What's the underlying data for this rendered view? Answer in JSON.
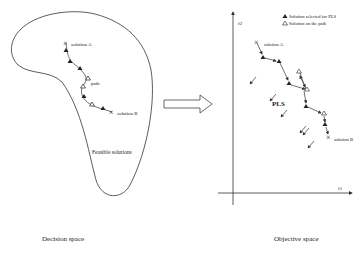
{
  "decision_space": {
    "caption": "Decision space",
    "region_label": "Feasible solutions",
    "solution_a_label": "solution A",
    "solution_b_label": "solution B",
    "path_label": "path"
  },
  "objective_space": {
    "caption": "Objective space",
    "y_axis_label": "f2",
    "x_axis_label": "f1",
    "solution_a_label": "solution A",
    "solution_b_label": "solution B",
    "method_label": "PLS",
    "legend": [
      {
        "symbol": "filled-triangle",
        "label": "Solution selected for PLS"
      },
      {
        "symbol": "hollow-triangle",
        "label": "Solution on the path"
      }
    ]
  },
  "colors": {
    "stroke": "#333333",
    "text": "#222222",
    "background": "#ffffff"
  }
}
